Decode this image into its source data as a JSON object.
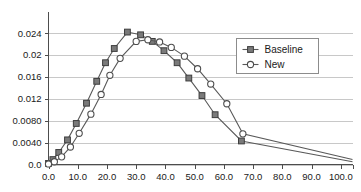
{
  "chart_data": {
    "type": "line",
    "title": "",
    "subtitle": "",
    "xlabel": "",
    "ylabel": "",
    "xlim": [
      0,
      104
    ],
    "ylim": [
      0,
      0.0265
    ],
    "grid": true,
    "grid_axis": "y",
    "legend_position": "right-upper-inside",
    "x_tick_labels": [
      "0.0",
      "10.0",
      "20.0",
      "30.0",
      "40.0",
      "50.0",
      "60.0",
      "70.0",
      "80.0",
      "90.0",
      "100.0"
    ],
    "x_tick_values": [
      0,
      10,
      20,
      30,
      40,
      50,
      60,
      70,
      80,
      90,
      100
    ],
    "y_tick_labels": [
      "0.0",
      "0.0040",
      "0.0080",
      "0.012",
      "0.016",
      "0.02",
      "0.024"
    ],
    "y_tick_values": [
      0,
      0.004,
      0.008,
      0.012,
      0.016,
      0.02,
      0.024
    ],
    "series": [
      {
        "name": "Baseline",
        "marker": "filled-square",
        "color": "#7a7a7a",
        "line_color": "#595959",
        "x": [
          0,
          1.5,
          3.5,
          6.5,
          9.5,
          13,
          16.5,
          19.5,
          22.5,
          27,
          31.5,
          35.5,
          39.5,
          44,
          48,
          52.5,
          57,
          66,
          104
        ],
        "y": [
          0.0002,
          0.0009,
          0.0022,
          0.0045,
          0.0075,
          0.0112,
          0.0152,
          0.0186,
          0.0212,
          0.0242,
          0.0237,
          0.0225,
          0.0208,
          0.0186,
          0.0158,
          0.0126,
          0.0091,
          0.0043,
          0.0005
        ]
      },
      {
        "name": "New",
        "marker": "open-circle",
        "color": "#ffffff",
        "line_color": "#595959",
        "x": [
          0,
          2,
          4.5,
          7.5,
          10.5,
          14.5,
          18,
          21,
          24.5,
          30,
          34,
          38,
          42,
          46.5,
          51,
          55.5,
          61,
          66.5,
          104
        ],
        "y": [
          0.0001,
          0.0005,
          0.0014,
          0.0032,
          0.0057,
          0.0092,
          0.0128,
          0.0163,
          0.0194,
          0.0225,
          0.0228,
          0.0224,
          0.0214,
          0.0198,
          0.0175,
          0.0147,
          0.0111,
          0.0056,
          0.0009
        ]
      }
    ]
  },
  "legend": {
    "entries": [
      {
        "label": "Baseline",
        "marker": "filled-square"
      },
      {
        "label": "New",
        "marker": "open-circle"
      }
    ]
  }
}
